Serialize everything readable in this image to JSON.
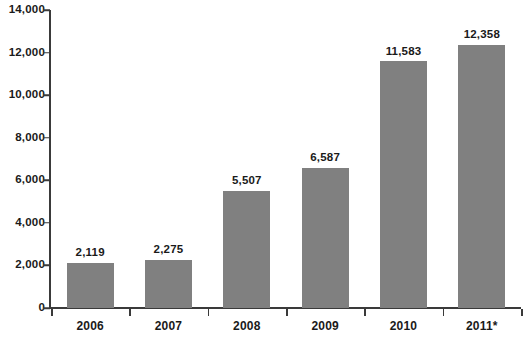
{
  "chart_data": {
    "type": "bar",
    "title": "",
    "subtitle": "",
    "xlabel": "",
    "ylabel": "",
    "categories": [
      "2006",
      "2007",
      "2008",
      "2009",
      "2010",
      "2011*"
    ],
    "values": [
      2119,
      2275,
      5507,
      6587,
      11583,
      12358
    ],
    "value_labels": [
      "2,119",
      "2,275",
      "5,507",
      "6,587",
      "11,583",
      "12,358"
    ],
    "ylim": [
      0,
      14000
    ],
    "ytick_values": [
      0,
      2000,
      4000,
      6000,
      8000,
      10000,
      12000,
      14000
    ],
    "ytick_labels": [
      "0",
      "2,000",
      "4,000",
      "6,000",
      "8,000",
      "10,000",
      "12,000",
      "14,000"
    ],
    "grid": false,
    "legend": null,
    "legend_position": "none",
    "annotations": [
      "* denotes preliminary/estimated value for 2011"
    ],
    "series": [
      {
        "name": "",
        "values": [
          2119,
          2275,
          5507,
          6587,
          11583,
          12358
        ]
      }
    ],
    "colors": {
      "bar_fill": "#808080",
      "axis": "#3a3a3a",
      "text": "#1a1a1a",
      "background": "#ffffff"
    }
  }
}
